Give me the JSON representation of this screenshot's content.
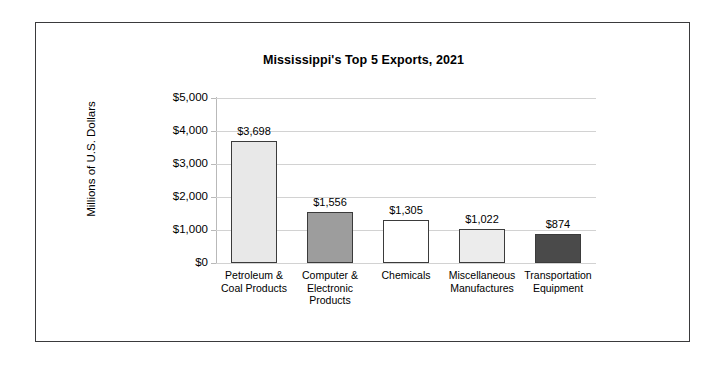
{
  "chart_data": {
    "type": "bar",
    "title": "Mississippi's Top 5 Exports, 2021",
    "xlabel": "",
    "ylabel": "Millions of U.S. Dollars",
    "ylim": [
      0,
      5000
    ],
    "ytick_labels": [
      "$5,000",
      "$4,000",
      "$3,000",
      "$2,000",
      "$1,000",
      "$0"
    ],
    "ytick_values": [
      5000,
      4000,
      3000,
      2000,
      1000,
      0
    ],
    "grid": true,
    "legend": "none",
    "categories": [
      "Petroleum & Coal Products",
      "Computer & Electronic Products",
      "Chemicals",
      "Miscellaneous Manufactures",
      "Transportation Equipment"
    ],
    "category_lines": [
      [
        "Petroleum &",
        "Coal Products"
      ],
      [
        "Computer &",
        "Electronic",
        "Products"
      ],
      [
        "Chemicals"
      ],
      [
        "Miscellaneous",
        "Manufactures"
      ],
      [
        "Transportation",
        "Equipment"
      ]
    ],
    "values": [
      3698,
      1556,
      1305,
      1022,
      874
    ],
    "value_labels": [
      "$3,698",
      "$1,556",
      "$1,305",
      "$1,022",
      "$874"
    ],
    "bar_colors": [
      "#e8e8e8",
      "#9d9d9d",
      "#ffffff",
      "#ececec",
      "#4a4a4a"
    ],
    "bar_border_color": "#3b3b3b",
    "gridline_color": "#d2d2d2",
    "frame_color": "#3a3a3c",
    "background_color": "#ffffff"
  }
}
